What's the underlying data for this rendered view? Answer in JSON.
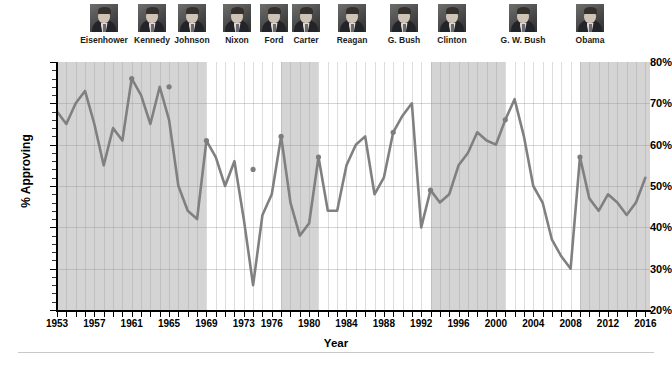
{
  "chart_data": {
    "type": "line",
    "title": "",
    "xlabel": "Year",
    "ylabel": "% Approving",
    "ylim": [
      20,
      80
    ],
    "xlim": [
      1953,
      2016.5
    ],
    "grid": true,
    "legend": "none",
    "y_tick_labels": [
      "80%",
      "70%",
      "60%",
      "50%",
      "40%",
      "30%",
      "20%"
    ],
    "y_ticks": [
      80,
      70,
      60,
      50,
      40,
      30,
      20
    ],
    "x_tick_labels": [
      "1953",
      "1957",
      "1961",
      "1965",
      "1969",
      "1973",
      "1976",
      "1980",
      "1984",
      "1988",
      "1992",
      "1996",
      "2000",
      "2004",
      "2008",
      "2012",
      "2016"
    ],
    "x_ticks": [
      1953,
      1957,
      1961,
      1965,
      1969,
      1973,
      1976,
      1980,
      1984,
      1988,
      1992,
      1996,
      2000,
      2004,
      2008,
      2012,
      2016
    ],
    "series": [
      {
        "name": "Presidential job approval",
        "color": "#808080",
        "x": [
          1953,
          1954,
          1955,
          1956,
          1957,
          1958,
          1959,
          1960,
          1961,
          1962,
          1963,
          1964,
          1965,
          1966,
          1967,
          1968,
          1969,
          1970,
          1971,
          1972,
          1973,
          1974,
          1975,
          1976,
          1977,
          1978,
          1979,
          1980,
          1981,
          1982,
          1983,
          1984,
          1985,
          1986,
          1987,
          1988,
          1989,
          1990,
          1991,
          1992,
          1993,
          1994,
          1995,
          1996,
          1997,
          1998,
          1999,
          2000,
          2001,
          2002,
          2003,
          2004,
          2005,
          2006,
          2007,
          2008,
          2009,
          2010,
          2011,
          2012,
          2013,
          2014,
          2015,
          2016
        ],
        "y": [
          68,
          65,
          70,
          73,
          65,
          55,
          64,
          61,
          76,
          72,
          65,
          74,
          66,
          50,
          44,
          42,
          61,
          57,
          50,
          56,
          42,
          26,
          43,
          48,
          62,
          46,
          38,
          41,
          57,
          44,
          44,
          55,
          60,
          62,
          48,
          52,
          63,
          67,
          70,
          40,
          49,
          46,
          48,
          55,
          58,
          63,
          61,
          60,
          66,
          71,
          62,
          50,
          46,
          37,
          33,
          30,
          57,
          47,
          44,
          48,
          46,
          43,
          46,
          52
        ]
      }
    ],
    "highlighted_points": [
      {
        "x": 1961,
        "y": 76
      },
      {
        "x": 1965,
        "y": 74
      },
      {
        "x": 1969,
        "y": 61
      },
      {
        "x": 1974,
        "y": 54
      },
      {
        "x": 1977,
        "y": 62
      },
      {
        "x": 1981,
        "y": 57
      },
      {
        "x": 1989,
        "y": 63
      },
      {
        "x": 1993,
        "y": 49
      },
      {
        "x": 2001,
        "y": 66
      },
      {
        "x": 2009,
        "y": 57
      }
    ],
    "term_bands": [
      {
        "start": 1953.0,
        "end": 1961.0,
        "shaded": true
      },
      {
        "start": 1961.0,
        "end": 1969.0,
        "shaded": true
      },
      {
        "start": 1969.0,
        "end": 1977.0,
        "shaded": false
      },
      {
        "start": 1977.0,
        "end": 1981.0,
        "shaded": true
      },
      {
        "start": 1981.0,
        "end": 1989.0,
        "shaded": false
      },
      {
        "start": 1989.0,
        "end": 1993.0,
        "shaded": false
      },
      {
        "start": 1993.0,
        "end": 2001.0,
        "shaded": true
      },
      {
        "start": 2001.0,
        "end": 2009.0,
        "shaded": false
      },
      {
        "start": 2009.0,
        "end": 2016.5,
        "shaded": true
      }
    ]
  },
  "presidents": [
    {
      "name": "Eisenhower",
      "center_x": 104
    },
    {
      "name": "Kennedy",
      "center_x": 152
    },
    {
      "name": "Johnson",
      "center_x": 192
    },
    {
      "name": "Nixon",
      "center_x": 237
    },
    {
      "name": "Ford",
      "center_x": 274
    },
    {
      "name": "Carter",
      "center_x": 306
    },
    {
      "name": "Reagan",
      "center_x": 352
    },
    {
      "name": "G. Bush",
      "center_x": 404
    },
    {
      "name": "Clinton",
      "center_x": 452
    },
    {
      "name": "G. W. Bush",
      "center_x": 523
    },
    {
      "name": "Obama",
      "center_x": 590
    }
  ],
  "colors": {
    "line": "#808080",
    "marker": "#7d7d7d",
    "band_shaded": "#d4d4d4",
    "band_open": "#ffffff",
    "axis": "#000000",
    "grid": "#9a9a9a",
    "footer_rule": "#c9c9c9"
  }
}
